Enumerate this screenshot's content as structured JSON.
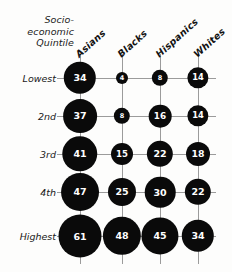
{
  "chart_data": {
    "type": "bar",
    "title": "",
    "subtitle": "",
    "xlabel": "",
    "ylabel": "Socio-economic Quintile",
    "row_axis_title_lines": [
      "Socio-",
      "economic",
      "Quintile"
    ],
    "categories": [
      "Asians",
      "Blacks",
      "Hispanics",
      "Whites"
    ],
    "rows": [
      "Lowest",
      "2nd",
      "3rd",
      "4th",
      "Highest"
    ],
    "series": [
      {
        "name": "Lowest",
        "values": [
          34,
          4,
          8,
          14
        ]
      },
      {
        "name": "2nd",
        "values": [
          37,
          8,
          16,
          14
        ]
      },
      {
        "name": "3rd",
        "values": [
          41,
          15,
          22,
          18
        ]
      },
      {
        "name": "4th",
        "values": [
          47,
          25,
          30,
          22
        ]
      },
      {
        "name": "Highest",
        "values": [
          61,
          48,
          45,
          34
        ]
      }
    ],
    "cells": [
      [
        {
          "row": "Lowest",
          "category": "Asians",
          "value": 34
        },
        {
          "row": "Lowest",
          "category": "Blacks",
          "value": 4
        },
        {
          "row": "Lowest",
          "category": "Hispanics",
          "value": 8
        },
        {
          "row": "Lowest",
          "category": "Whites",
          "value": 14
        }
      ],
      [
        {
          "row": "2nd",
          "category": "Asians",
          "value": 37
        },
        {
          "row": "2nd",
          "category": "Blacks",
          "value": 8
        },
        {
          "row": "2nd",
          "category": "Hispanics",
          "value": 16
        },
        {
          "row": "2nd",
          "category": "Whites",
          "value": 14
        }
      ],
      [
        {
          "row": "3rd",
          "category": "Asians",
          "value": 41
        },
        {
          "row": "3rd",
          "category": "Blacks",
          "value": 15
        },
        {
          "row": "3rd",
          "category": "Hispanics",
          "value": 22
        },
        {
          "row": "3rd",
          "category": "Whites",
          "value": 18
        }
      ],
      [
        {
          "row": "4th",
          "category": "Asians",
          "value": 47
        },
        {
          "row": "4th",
          "category": "Blacks",
          "value": 25
        },
        {
          "row": "4th",
          "category": "Hispanics",
          "value": 30
        },
        {
          "row": "4th",
          "category": "Whites",
          "value": 22
        }
      ],
      [
        {
          "row": "Highest",
          "category": "Asians",
          "value": 61
        },
        {
          "row": "Highest",
          "category": "Blacks",
          "value": 48
        },
        {
          "row": "Highest",
          "category": "Hispanics",
          "value": 45
        },
        {
          "row": "Highest",
          "category": "Whites",
          "value": 34
        }
      ]
    ],
    "grid": true,
    "legend": "none",
    "bubble_color": "#0a0a0a",
    "label_color": "#ffffff",
    "grid_color": "#9b9b9b",
    "background_color": "#fdfdfc"
  },
  "layout": {
    "col_x": [
      80,
      122,
      160,
      198
    ],
    "row_y": [
      78,
      116,
      154,
      192,
      236
    ],
    "grid_left": 57,
    "grid_right": 216,
    "grid_top": 54,
    "grid_bottom": 264,
    "header_anchor_y": 50,
    "radius_min": 6,
    "radius_max": 21.5
  }
}
